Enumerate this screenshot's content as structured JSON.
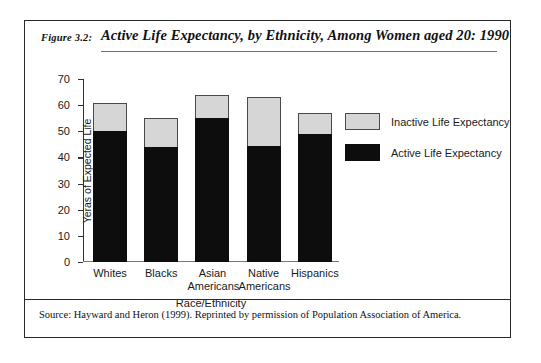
{
  "figure": {
    "number": "Figure 3.2:",
    "title": "Active Life Expectancy, by Ethnicity, Among Women aged 20: 1990",
    "source_note": "Source: Hayward and Heron (1999). Reprinted by permission of Population Association of America."
  },
  "legend": {
    "items": [
      {
        "label": "Inactive Life Expectancy",
        "color": "#d6d6d6"
      },
      {
        "label": "Active Life Expectancy",
        "color": "#0d0d0d"
      }
    ]
  },
  "chart_data": {
    "type": "bar",
    "stacked": true,
    "title": "Active Life Expectancy, by Ethnicity, Among Women aged 20: 1990",
    "xlabel": "Race/Ethnicity",
    "ylabel": "Yeras of Expected Life",
    "ylim": [
      0,
      70
    ],
    "yticks": [
      0,
      10,
      20,
      30,
      40,
      50,
      60,
      70
    ],
    "ytick_labels": [
      "0",
      "10",
      "20",
      "30",
      "40",
      "50",
      "60",
      "70"
    ],
    "grid": false,
    "legend_position": "right",
    "categories": [
      "Whites",
      "Blacks",
      "Asian Americans",
      "Native Americans",
      "Hispanics"
    ],
    "category_lines": [
      [
        "Whites"
      ],
      [
        "Blacks"
      ],
      [
        "Asian",
        "Americans"
      ],
      [
        "Native",
        "Americans"
      ],
      [
        "Hispanics"
      ]
    ],
    "series": [
      {
        "name": "Active Life Expectancy",
        "color": "#0d0d0d",
        "values": [
          50,
          44,
          55,
          44.5,
          49
        ]
      },
      {
        "name": "Inactive Life Expectancy",
        "color": "#d6d6d6",
        "values": [
          11,
          11,
          9,
          18.5,
          8
        ]
      }
    ],
    "totals": [
      61,
      55,
      64,
      63,
      57
    ]
  }
}
